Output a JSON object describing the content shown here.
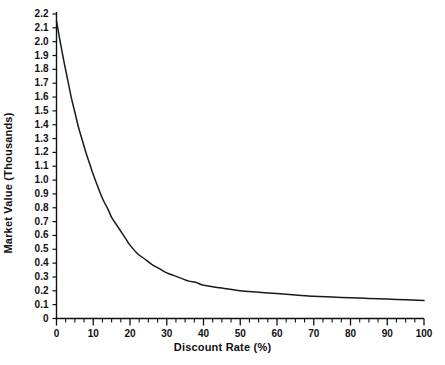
{
  "chart_data": {
    "type": "line",
    "title": "",
    "xlabel": "Discount Rate (%)",
    "ylabel": "Market Value (Thousands)",
    "xlim": [
      0,
      100
    ],
    "ylim": [
      0,
      2.2
    ],
    "grid": false,
    "legend": false,
    "line_color": "#1a1a1a",
    "x_major_ticks": [
      0,
      10,
      20,
      30,
      40,
      50,
      60,
      70,
      80,
      90,
      100
    ],
    "x_tick_labels": [
      "0",
      "10",
      "20",
      "30",
      "40",
      "50",
      "60",
      "70",
      "80",
      "90",
      "100"
    ],
    "x_minor_tick_step": 2.5,
    "y_major_ticks": [
      0,
      0.1,
      0.2,
      0.3,
      0.4,
      0.5,
      0.6,
      0.7,
      0.8,
      0.9,
      1.0,
      1.1,
      1.2,
      1.3,
      1.4,
      1.5,
      1.6,
      1.7,
      1.8,
      1.9,
      2.0,
      2.1,
      2.2
    ],
    "y_tick_labels": [
      "0",
      "0.1",
      "0.2",
      "0.3",
      "0.4",
      "0.5",
      "0.6",
      "0.7",
      "0.8",
      "0.9",
      "1.0",
      "1.1",
      "1.2",
      "1.3",
      "1.4",
      "1.5",
      "1.6",
      "1.7",
      "1.8",
      "1.9",
      "2.0",
      "2.1",
      "2.2"
    ],
    "x": [
      0,
      1,
      2,
      3,
      4,
      5,
      6,
      7,
      8,
      9,
      10,
      11,
      12,
      13,
      14,
      15,
      16,
      17,
      18,
      19,
      20,
      22,
      24,
      26,
      28,
      30,
      32,
      34,
      36,
      38,
      40,
      45,
      50,
      55,
      60,
      65,
      70,
      75,
      80,
      85,
      90,
      95,
      100
    ],
    "values": [
      2.15,
      2.0,
      1.86,
      1.73,
      1.6,
      1.49,
      1.38,
      1.29,
      1.2,
      1.12,
      1.04,
      0.97,
      0.9,
      0.84,
      0.79,
      0.73,
      0.69,
      0.65,
      0.61,
      0.57,
      0.53,
      0.47,
      0.43,
      0.39,
      0.36,
      0.33,
      0.31,
      0.29,
      0.27,
      0.26,
      0.24,
      0.22,
      0.2,
      0.19,
      0.18,
      0.17,
      0.16,
      0.155,
      0.15,
      0.145,
      0.14,
      0.135,
      0.13
    ],
    "series_name": "Market Value vs Discount Rate"
  },
  "axes": {
    "x_title": "Discount Rate (%)",
    "y_title": "Market Value (Thousands)"
  }
}
